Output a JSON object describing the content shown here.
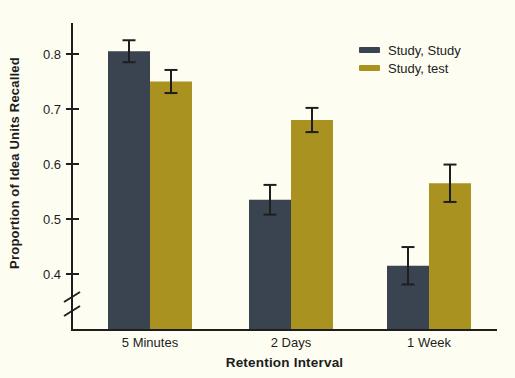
{
  "colors": {
    "background": "#fdfdf2",
    "ink": "#1e1e1e",
    "series_dark": "#3a4450",
    "series_gold": "#a9921f"
  },
  "chart_data": {
    "type": "bar",
    "title": "",
    "xlabel": "Retention Interval",
    "ylabel": "Proportion of Idea Units Recalled",
    "categories": [
      "5 Minutes",
      "2 Days",
      "1 Week"
    ],
    "series": [
      {
        "name": "Study, Study",
        "color": "#3a4450",
        "values": [
          0.805,
          0.535,
          0.415
        ],
        "errors": [
          0.02,
          0.027,
          0.034
        ]
      },
      {
        "name": "Study, test",
        "color": "#a9921f",
        "values": [
          0.75,
          0.68,
          0.565
        ],
        "errors": [
          0.021,
          0.022,
          0.034
        ]
      }
    ],
    "y_ticks": [
      0.4,
      0.5,
      0.6,
      0.7,
      0.8
    ],
    "y_tick_labels": [
      "0.4",
      "0.5",
      "0.6",
      "0.7",
      "0.8"
    ],
    "ylim": [
      0.35,
      0.856
    ],
    "axis_break_below_min": true,
    "error_bars": true,
    "grid": false,
    "legend_position": "top-right"
  }
}
